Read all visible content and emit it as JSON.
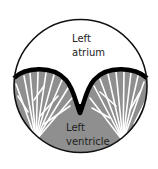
{
  "diagram": {
    "type": "anatomical cross-section",
    "labels": {
      "atrium_line1": "Left",
      "atrium_line2": "atrium",
      "ventricle_line1": "Left",
      "ventricle_line2": "ventricle"
    },
    "colors": {
      "background": "#ffffff",
      "atrium_fill": "#ffffff",
      "ventricle_fill": "#8f8f8f",
      "outline": "#111111",
      "valve": "#000000",
      "chordae": "#ffffff",
      "text": "#222222"
    }
  }
}
